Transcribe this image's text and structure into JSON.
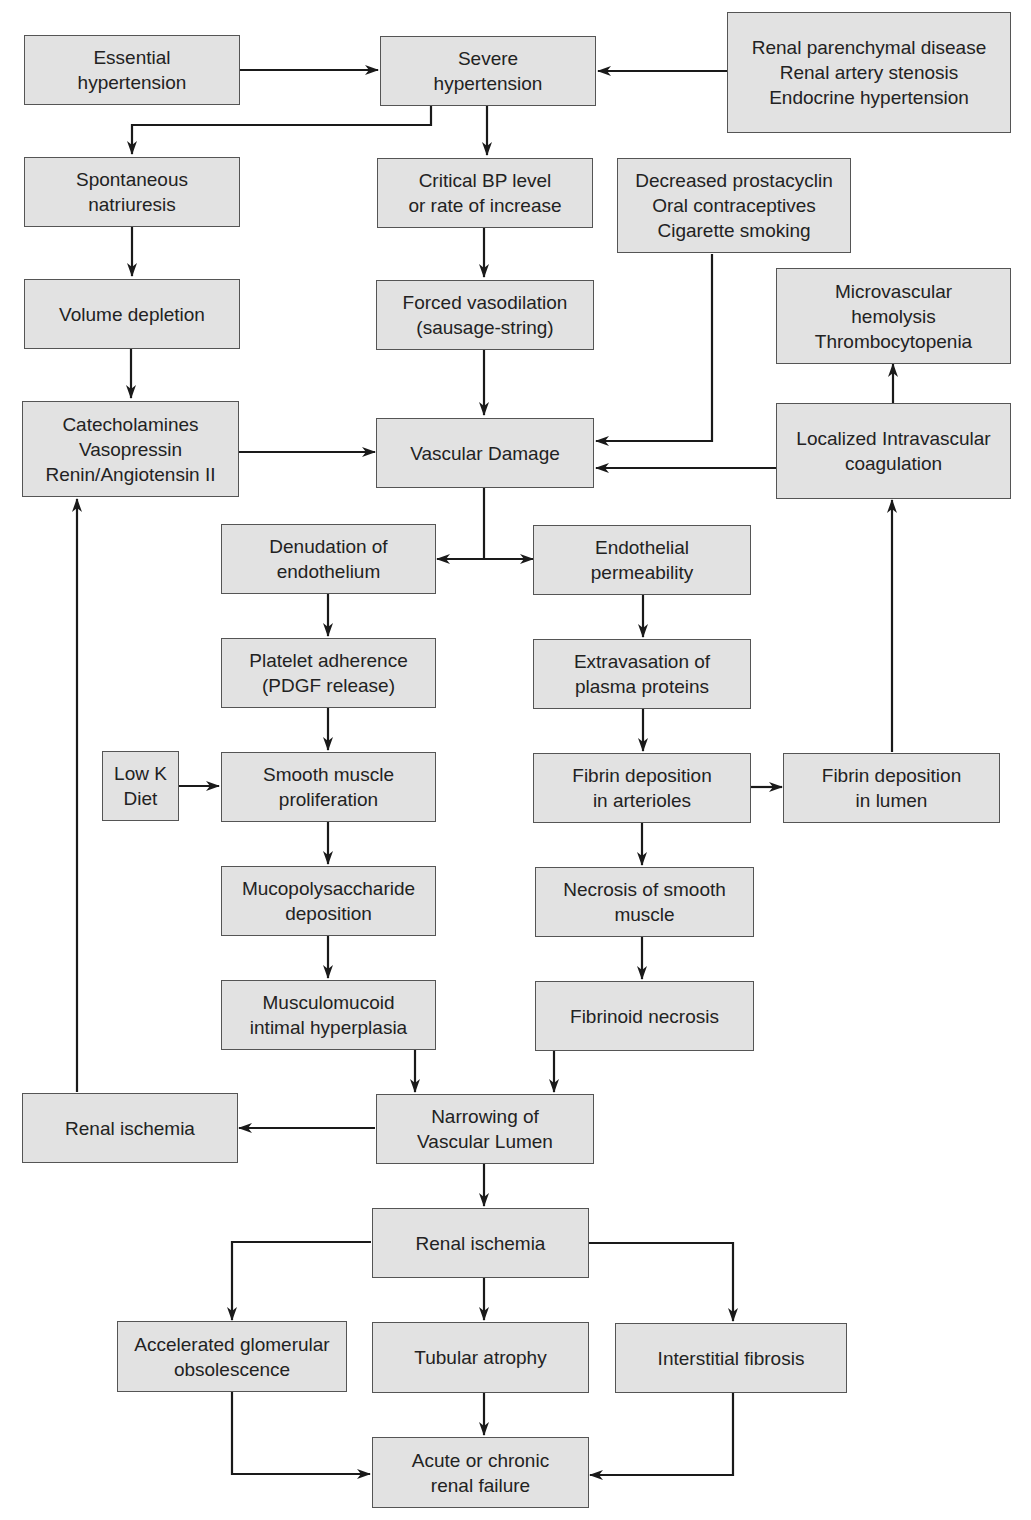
{
  "colors": {
    "box_fill": "#e2e2e2",
    "box_border": "#555555",
    "arrow": "#1a1a1a",
    "text": "#222222"
  },
  "nodes": {
    "essential_hypertension": {
      "lines": [
        "Essential",
        "hypertension"
      ]
    },
    "severe_hypertension": {
      "lines": [
        "Severe",
        "hypertension"
      ]
    },
    "secondary_causes": {
      "lines": [
        "Renal parenchymal disease",
        "Renal artery stenosis",
        "Endocrine hypertension"
      ]
    },
    "spontaneous_natriuresis": {
      "lines": [
        "Spontaneous",
        "natriuresis"
      ]
    },
    "critical_bp": {
      "lines": [
        "Critical BP level",
        "or rate of increase"
      ]
    },
    "prostacyclin_factors": {
      "lines": [
        "Decreased prostacyclin",
        "Oral contraceptives",
        "Cigarette smoking"
      ]
    },
    "volume_depletion": {
      "lines": [
        "Volume depletion"
      ]
    },
    "forced_vasodilation": {
      "lines": [
        "Forced vasodilation",
        "(sausage-string)"
      ]
    },
    "microvascular_hemolysis": {
      "lines": [
        "Microvascular",
        "hemolysis",
        "Thrombocytopenia"
      ]
    },
    "vasoactive_hormones": {
      "lines": [
        "Catecholamines",
        "Vasopressin",
        "Renin/Angiotensin II"
      ]
    },
    "vascular_damage": {
      "lines": [
        "Vascular Damage"
      ]
    },
    "localized_coagulation": {
      "lines": [
        "Localized Intravascular",
        "coagulation"
      ]
    },
    "denudation": {
      "lines": [
        "Denudation of",
        "endothelium"
      ]
    },
    "endothelial_permeability": {
      "lines": [
        "Endothelial",
        "permeability"
      ]
    },
    "platelet_adherence": {
      "lines": [
        "Platelet adherence",
        "(PDGF release)"
      ]
    },
    "extravasation": {
      "lines": [
        "Extravasation of",
        "plasma proteins"
      ]
    },
    "low_k_diet": {
      "lines": [
        "Low K",
        "Diet"
      ]
    },
    "smooth_muscle_proliferation": {
      "lines": [
        "Smooth muscle",
        "proliferation"
      ]
    },
    "fibrin_arterioles": {
      "lines": [
        "Fibrin deposition",
        "in arterioles"
      ]
    },
    "fibrin_lumen": {
      "lines": [
        "Fibrin deposition",
        "in lumen"
      ]
    },
    "mucopolysaccharide": {
      "lines": [
        "Mucopolysaccharide",
        "deposition"
      ]
    },
    "necrosis_smooth_muscle": {
      "lines": [
        "Necrosis of smooth",
        "muscle"
      ]
    },
    "musculomucoid": {
      "lines": [
        "Musculomucoid",
        "intimal hyperplasia"
      ]
    },
    "fibrinoid_necrosis": {
      "lines": [
        "Fibrinoid necrosis"
      ]
    },
    "renal_ischemia_left": {
      "lines": [
        "Renal ischemia"
      ]
    },
    "narrowing_lumen": {
      "lines": [
        "Narrowing of",
        "Vascular Lumen"
      ]
    },
    "renal_ischemia_center": {
      "lines": [
        "Renal ischemia"
      ]
    },
    "glomerular_obsolescence": {
      "lines": [
        "Accelerated glomerular",
        "obsolescence"
      ]
    },
    "tubular_atrophy": {
      "lines": [
        "Tubular atrophy"
      ]
    },
    "interstitial_fibrosis": {
      "lines": [
        "Interstitial fibrosis"
      ]
    },
    "renal_failure": {
      "lines": [
        "Acute or chronic",
        "renal failure"
      ]
    }
  }
}
